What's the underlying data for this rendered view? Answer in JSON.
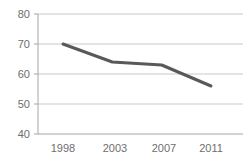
{
  "chart_data": {
    "type": "line",
    "title": "",
    "subtitle": "",
    "xlabel": "",
    "ylabel": "",
    "categories": [
      "1998",
      "2003",
      "2007",
      "2011"
    ],
    "x": [
      1998,
      2003,
      2007,
      2011
    ],
    "values": [
      70,
      64,
      63,
      56
    ],
    "series": [
      {
        "name": "Series 1",
        "values": [
          70,
          64,
          63,
          56
        ],
        "color": "#595959"
      }
    ],
    "ylim": [
      40,
      80
    ],
    "yticks": [
      40,
      50,
      60,
      70,
      80
    ],
    "ytick_labels": [
      "40",
      "50",
      "60",
      "70",
      "80"
    ],
    "xtick_labels": [
      "1998",
      "2003",
      "2007",
      "2011"
    ],
    "grid": true,
    "grid_axis": "y",
    "grid_color": "#c9c9c9",
    "axis_color": "#a6a6a6",
    "legend": false,
    "legend_position": "none",
    "markers": false,
    "line_width": 3,
    "background": "#ffffff",
    "annotations": []
  },
  "axes": {
    "y_labels": [
      {
        "text": "80",
        "value": 80
      },
      {
        "text": "70",
        "value": 70
      },
      {
        "text": "60",
        "value": 60
      },
      {
        "text": "50",
        "value": 50
      },
      {
        "text": "40",
        "value": 40
      }
    ],
    "x_labels": [
      {
        "text": "1998",
        "value": 1998
      },
      {
        "text": "2003",
        "value": 2003
      },
      {
        "text": "2007",
        "value": 2007
      },
      {
        "text": "2011",
        "value": 2011
      }
    ]
  }
}
